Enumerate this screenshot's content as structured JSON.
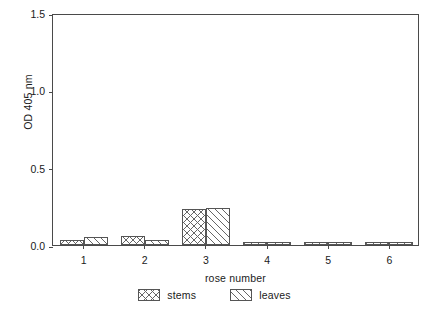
{
  "chart_data": {
    "type": "bar",
    "title": "",
    "subtitle": "",
    "xlabel": "rose number",
    "ylabel": "OD 405 nm",
    "categories": [
      "1",
      "2",
      "3",
      "4",
      "5",
      "6"
    ],
    "series": [
      {
        "name": "stems",
        "values": [
          0.03,
          0.06,
          0.23,
          0.02,
          0.02,
          0.02
        ]
      },
      {
        "name": "leaves",
        "values": [
          0.05,
          0.03,
          0.24,
          0.02,
          0.02,
          0.02
        ]
      }
    ],
    "ylim": [
      0.0,
      1.5
    ],
    "yticks": [
      "0.0",
      "0.5",
      "1.0",
      "1.5"
    ],
    "ytick_values": [
      0.0,
      0.5,
      1.0,
      1.5
    ],
    "xtick_labels": [
      "1",
      "2",
      "3",
      "4",
      "5",
      "6"
    ],
    "grid": false,
    "legend_position": "below",
    "legend": [
      "stems",
      "leaves"
    ],
    "colors": {
      "axis": "#4a4a4a",
      "bar_edge": "#555555",
      "hatch": "#666666",
      "background": "#ffffff",
      "text": "#1a1a1a"
    }
  }
}
